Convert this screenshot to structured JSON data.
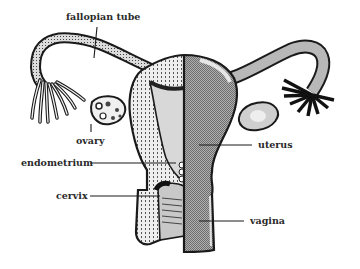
{
  "diagram": {
    "labels": {
      "fallopian_tube": "fallopian tube",
      "ovary": "ovary",
      "endometrium": "endometrium",
      "cervix": "cervix",
      "uterus": "uterus",
      "vagina": "vagina"
    },
    "colors": {
      "outline": "#1a1a1a",
      "stipple_fill": "#e4e4e4",
      "gray_fill": "#9a9a9a",
      "light_gray": "#c8c8c8",
      "background": "#ffffff"
    }
  }
}
